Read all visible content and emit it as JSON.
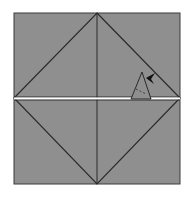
{
  "diagram": {
    "type": "origami-fold-diagram",
    "background_color": "#ffffff",
    "paper_color": "#8f8f8f",
    "line_color": "#2a2a2a",
    "fold_line_color": "#ffffff",
    "square": {
      "x": 14,
      "y": 13,
      "width": 166,
      "height": 171
    },
    "horizontal_fold_y": 98.5,
    "vertical_crease_x": 97,
    "diamond": {
      "top": [
        97,
        13
      ],
      "right": [
        180,
        98
      ],
      "bottom": [
        97,
        184
      ],
      "left": [
        14,
        98
      ]
    },
    "flap": {
      "apex": [
        142,
        72
      ],
      "base_left": [
        131,
        99
      ],
      "base_right": [
        151,
        99
      ],
      "inner_dash": [
        [
          136,
          89
        ],
        [
          146,
          94
        ]
      ]
    },
    "arrow": {
      "tip": [
        146,
        78
      ],
      "direction": "left-down",
      "icon": "arrowhead-icon"
    }
  }
}
